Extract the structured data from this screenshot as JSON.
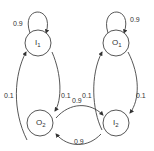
{
  "diagram": {
    "type": "state-transition",
    "nodes": [
      {
        "id": "I1",
        "label": "I",
        "sub": "1"
      },
      {
        "id": "O1",
        "label": "O",
        "sub": "1"
      },
      {
        "id": "O2",
        "label": "O",
        "sub": "2"
      },
      {
        "id": "I2",
        "label": "I",
        "sub": "2"
      }
    ],
    "edges": [
      {
        "from": "I1",
        "to": "I1",
        "label": "0.9"
      },
      {
        "from": "O1",
        "to": "O1",
        "label": "0.9"
      },
      {
        "from": "O2",
        "to": "I1",
        "label": "0.1"
      },
      {
        "from": "I1",
        "to": "O2",
        "label": "0.1"
      },
      {
        "from": "I2",
        "to": "O1",
        "label": "0.1"
      },
      {
        "from": "O1",
        "to": "I2",
        "label": "0.1"
      },
      {
        "from": "O2",
        "to": "I2",
        "label": "0.9"
      },
      {
        "from": "I2",
        "to": "O2",
        "label": "0.9"
      }
    ]
  }
}
